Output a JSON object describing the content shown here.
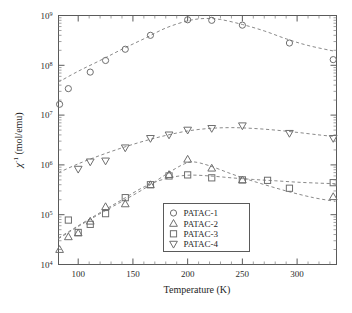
{
  "chart_data": {
    "type": "scatter",
    "title": "",
    "xlabel": "Temperature (K)",
    "ylabel": "χ⁻¹ (mol/emu)",
    "xscale": "linear",
    "yscale": "log",
    "xlim": [
      82,
      336
    ],
    "ylim": [
      10000,
      1000000000
    ],
    "grid": false,
    "legend_position": "inside-lower-center",
    "xticks": [
      100,
      150,
      200,
      250,
      300
    ],
    "xticklabels": [
      "100",
      "150",
      "200",
      "250",
      "300"
    ],
    "yticks": [
      10000,
      100000,
      1000000,
      10000000,
      100000000,
      1000000000
    ],
    "yticklabels": [
      "10⁴",
      "10⁵",
      "10⁶",
      "10⁷",
      "10⁸",
      "10⁹"
    ],
    "ytick_mantissa": "10",
    "ytick_exponents": [
      "4",
      "5",
      "6",
      "7",
      "8",
      "9"
    ],
    "marker_color": "#6e6e6e",
    "fitline_color": "#8a8a8a",
    "axis_color": "#5a5a5a",
    "series": [
      {
        "name": "PATAC-1",
        "marker": "circle",
        "x": [
          83,
          91,
          111,
          125,
          143,
          166,
          200,
          222,
          250,
          293,
          333
        ],
        "y": [
          16500000.0,
          34000000.0,
          73000000.0,
          125000000.0,
          210000000.0,
          400000000.0,
          820000000.0,
          800000000.0,
          640000000.0,
          280000000.0,
          130000000.0
        ],
        "fit_x": [
          82,
          100,
          120,
          140,
          160,
          180,
          200,
          215,
          230,
          250,
          270,
          290,
          310,
          335
        ],
        "fit_y": [
          46000000.0,
          76000000.0,
          125000000.0,
          210000000.0,
          340000000.0,
          560000000.0,
          780000000.0,
          870000000.0,
          830000000.0,
          660000000.0,
          490000000.0,
          340000000.0,
          250000000.0,
          190000000.0
        ]
      },
      {
        "name": "PATAC-2",
        "marker": "triangle-up",
        "x": [
          83,
          91,
          100,
          111,
          125,
          143,
          166,
          183,
          200,
          222,
          250,
          333
        ],
        "y": [
          20000.0,
          36000.0,
          43000.0,
          74000.0,
          145000.0,
          165000.0,
          400000.0,
          640000.0,
          1300000.0,
          860000.0,
          500000.0,
          230000.0
        ],
        "fit_x": [
          82,
          100,
          120,
          140,
          160,
          180,
          195,
          205,
          220,
          240,
          260,
          290,
          315,
          335
        ],
        "fit_y": [
          33000.0,
          58000.0,
          105000.0,
          185000.0,
          330000.0,
          640000.0,
          1000000.0,
          1150000.0,
          960000.0,
          660000.0,
          470000.0,
          300000.0,
          220000.0,
          185000.0
        ]
      },
      {
        "name": "PATAC-3",
        "marker": "square",
        "x": [
          91,
          100,
          111,
          125,
          143,
          166,
          183,
          200,
          222,
          250,
          273,
          293,
          333
        ],
        "y": [
          78000.0,
          44000.0,
          64000.0,
          105000.0,
          220000.0,
          400000.0,
          600000.0,
          630000.0,
          550000.0,
          500000.0,
          490000.0,
          340000.0,
          440000.0
        ],
        "fit_x": [
          82,
          100,
          120,
          140,
          160,
          180,
          200,
          220,
          240,
          260,
          280,
          300,
          320,
          335
        ],
        "fit_y": [
          34000.0,
          60000.0,
          110000.0,
          200000.0,
          360000.0,
          530000.0,
          620000.0,
          600000.0,
          550000.0,
          510000.0,
          480000.0,
          450000.0,
          430000.0,
          420000.0
        ]
      },
      {
        "name": "PATAC-4",
        "marker": "triangle-down",
        "x": [
          100,
          111,
          125,
          143,
          166,
          183,
          200,
          222,
          250,
          293,
          333
        ],
        "y": [
          820000.0,
          1150000.0,
          1200000.0,
          2200000.0,
          3400000.0,
          4000000.0,
          5000000.0,
          5400000.0,
          6100000.0,
          4300000.0,
          3400000.0
        ],
        "fit_x": [
          82,
          100,
          120,
          140,
          160,
          180,
          200,
          220,
          240,
          260,
          280,
          300,
          320,
          335
        ],
        "fit_y": [
          700000.0,
          1050000.0,
          1550000.0,
          2200000.0,
          3000000.0,
          3900000.0,
          4800000.0,
          5400000.0,
          5600000.0,
          5400000.0,
          5000000.0,
          4500000.0,
          4000000.0,
          3700000.0
        ]
      }
    ]
  },
  "legend": {
    "items": [
      {
        "label": "PATAC-1",
        "marker": "circle"
      },
      {
        "label": "PATAC-2",
        "marker": "triangle-up"
      },
      {
        "label": "PATAC-3",
        "marker": "square"
      },
      {
        "label": "PATAC-4",
        "marker": "triangle-down"
      }
    ]
  }
}
